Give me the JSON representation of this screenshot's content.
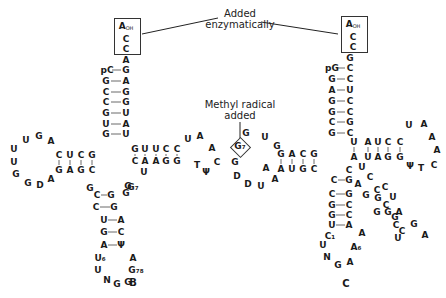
{
  "annotations": {
    "added_enzymatically_line1": "Added",
    "added_enzymatically_line2": "enzymatically",
    "methyl_line1": "Methyl radical",
    "methyl_line2": "added"
  },
  "captions": {
    "left": "B",
    "right": "C"
  },
  "structure_B": {
    "cca_end": [
      "A",
      "C",
      "C"
    ],
    "cca_end_sub": "OH",
    "acceptor_5prime": [
      "pC",
      "G",
      "C",
      "C",
      "G",
      "U",
      "G"
    ],
    "acceptor_3prime": [
      "A",
      "G",
      "A",
      "G",
      "G",
      "U",
      "A",
      "U"
    ],
    "d_stem_top": [
      "C",
      "U",
      "C",
      "G"
    ],
    "d_stem_bottom": [
      "G",
      "A",
      "G",
      "C"
    ],
    "d_loop": [
      "A",
      "G",
      "U",
      "U",
      "U",
      "G",
      "G",
      "D",
      "A"
    ],
    "t_stem_top": [
      "G",
      "U",
      "U",
      "C",
      "C"
    ],
    "t_stem_bottom": [
      "C",
      "A",
      "A",
      "G",
      "G"
    ],
    "t_loop": [
      "U",
      "A",
      "A",
      "C",
      "Ψ",
      "T"
    ],
    "anticodon_stem_left": [
      "C",
      "C",
      "U",
      "G",
      "A"
    ],
    "anticodon_stem_right": [
      "G",
      "G",
      "A",
      "C",
      "Ψ"
    ],
    "variable": [
      "G",
      "G",
      "G",
      "G₇",
      "U"
    ],
    "anticodon_loop": [
      "U₆",
      "U",
      "N",
      "G",
      "G",
      "G₇₈",
      "A"
    ]
  },
  "structure_C": {
    "cca_end": [
      "A",
      "C",
      "C"
    ],
    "cca_end_sub": "OH",
    "acceptor_5prime": [
      "pG",
      "G",
      "A",
      "G",
      "G",
      "C",
      "G"
    ],
    "acceptor_3prime": [
      "G",
      "C",
      "C",
      "U",
      "C",
      "C",
      "G",
      "C"
    ],
    "d_stem_top": [
      "G",
      "A",
      "C",
      "G"
    ],
    "d_stem_bottom": [
      "A",
      "U",
      "G",
      "C"
    ],
    "d_loop": [
      "G",
      "U",
      "G",
      "G₇",
      "G",
      "D",
      "D",
      "U",
      "A",
      "A"
    ],
    "t_stem_top": [
      "U",
      "A",
      "U",
      "C",
      "C"
    ],
    "t_stem_bottom": [
      "A",
      "U",
      "A",
      "G",
      "G"
    ],
    "t_loop": [
      "U",
      "A",
      "A",
      "A",
      "C",
      "Ψ",
      "T"
    ],
    "anticodon_stem_left": [
      "C",
      "C",
      "G",
      "G",
      "U"
    ],
    "anticodon_stem_right": [
      "G",
      "G",
      "C",
      "C",
      "A"
    ],
    "variable_arm": [
      "C",
      "U",
      "C",
      "A",
      "G",
      "G",
      "C",
      "G",
      "C",
      "U",
      "C",
      "G",
      "G",
      "C",
      "C",
      "U",
      "A",
      "G",
      "A"
    ],
    "anticodon_loop": [
      "C₁",
      "U",
      "N",
      "G",
      "A",
      "A₆",
      "A"
    ]
  }
}
